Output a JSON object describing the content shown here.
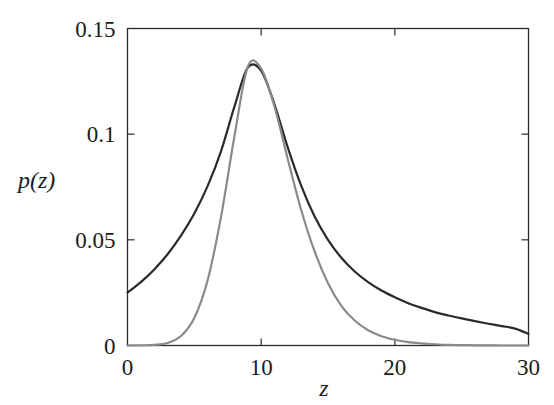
{
  "chart_data": {
    "type": "line",
    "title": "",
    "xlabel": "z",
    "ylabel": "p(z)",
    "xlim": [
      0,
      30
    ],
    "ylim": [
      0,
      0.15
    ],
    "xticks": [
      0,
      10,
      20,
      30
    ],
    "xtick_labels": [
      "0",
      "10",
      "20",
      "30"
    ],
    "yticks": [
      0,
      0.05,
      0.1,
      0.15
    ],
    "ytick_labels": [
      "0",
      "0.05",
      "0.1",
      "0.15"
    ],
    "grid": false,
    "legend": "none",
    "box_frame": true,
    "tick_direction": "in",
    "x": [
      0,
      1,
      2,
      3,
      4,
      5,
      6,
      7,
      8,
      9,
      10,
      11,
      12,
      13,
      14,
      15,
      16,
      17,
      18,
      19,
      20,
      21,
      22,
      23,
      24,
      25,
      26,
      27,
      28,
      29,
      30
    ],
    "series": [
      {
        "name": "heavy-tailed-density",
        "color": "#2a2a2a",
        "linewidth": 2.2,
        "values": [
          0.025,
          0.03,
          0.036,
          0.0432,
          0.052,
          0.0625,
          0.0755,
          0.092,
          0.113,
          0.1315,
          0.13,
          0.114,
          0.0935,
          0.0755,
          0.061,
          0.05,
          0.0415,
          0.035,
          0.03,
          0.026,
          0.0228,
          0.02,
          0.0178,
          0.0158,
          0.0142,
          0.0128,
          0.0115,
          0.0103,
          0.0092,
          0.008,
          0.0055
        ]
      },
      {
        "name": "gaussian-density",
        "color": "#8a8a8a",
        "linewidth": 2.2,
        "values": [
          0.0,
          0.0001,
          0.0003,
          0.0012,
          0.0045,
          0.013,
          0.031,
          0.061,
          0.099,
          0.132,
          0.131,
          0.113,
          0.088,
          0.064,
          0.0445,
          0.0295,
          0.0188,
          0.0118,
          0.0072,
          0.0044,
          0.0027,
          0.0016,
          0.001,
          0.0006,
          0.0003,
          0.0002,
          0.0001,
          0.0001,
          0.0,
          0.0,
          0.0
        ]
      }
    ]
  },
  "axes": {
    "x_tick_labels": [
      "0",
      "10",
      "20",
      "30"
    ],
    "y_tick_labels": [
      "0",
      "0.05",
      "0.1",
      "0.15"
    ],
    "x_axis_title": "z",
    "y_axis_title": "p(z)"
  }
}
